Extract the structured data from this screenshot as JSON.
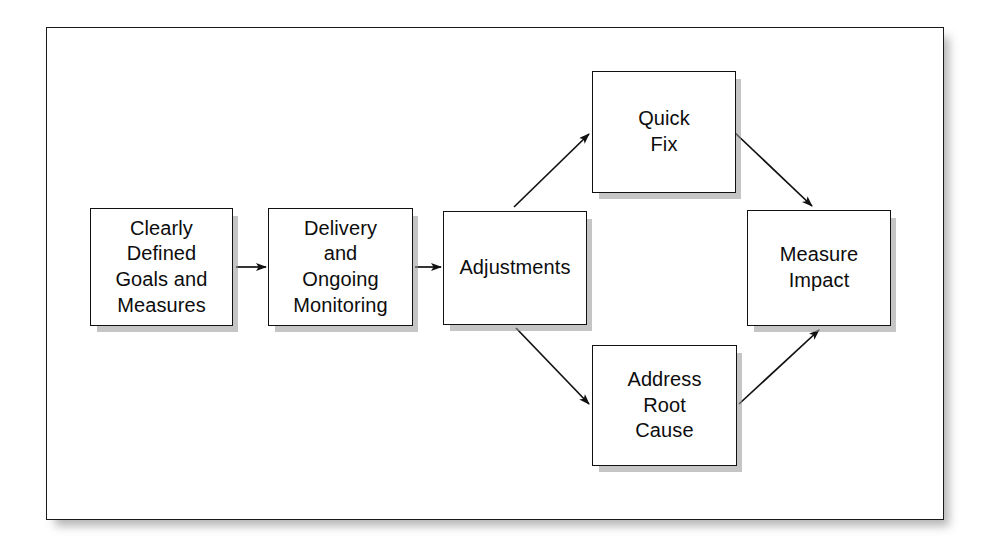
{
  "diagram": {
    "frame": {
      "border_color": "#1a1a1a",
      "background": "#ffffff"
    },
    "node_style": {
      "border_color": "#111111",
      "fill": "#ffffff",
      "shadow_color": "#969696",
      "text_color": "#0d0d0d"
    },
    "nodes": [
      {
        "id": "goals",
        "label": "Clearly\nDefined\nGoals and\nMeasures"
      },
      {
        "id": "delivery",
        "label": "Delivery\nand\nOngoing\nMonitoring"
      },
      {
        "id": "adjust",
        "label": "Adjustments"
      },
      {
        "id": "quickfix",
        "label": "Quick\nFix"
      },
      {
        "id": "rootcause",
        "label": "Address\nRoot\nCause"
      },
      {
        "id": "measure",
        "label": "Measure\nImpact"
      }
    ],
    "edges": [
      {
        "id": "goals-to-delivery",
        "from": "goals",
        "to": "delivery",
        "style": "straight-horizontal",
        "arrow": "end"
      },
      {
        "id": "delivery-to-adjust",
        "from": "delivery",
        "to": "adjust",
        "style": "straight-horizontal",
        "arrow": "end"
      },
      {
        "id": "adjust-to-quickfix",
        "from": "adjust",
        "to": "quickfix",
        "style": "diagonal-up",
        "arrow": "end"
      },
      {
        "id": "adjust-to-rootcause",
        "from": "adjust",
        "to": "rootcause",
        "style": "diagonal-down",
        "arrow": "end"
      },
      {
        "id": "quickfix-to-measure",
        "from": "quickfix",
        "to": "measure",
        "style": "diagonal-down",
        "arrow": "end"
      },
      {
        "id": "rootcause-to-measure",
        "from": "rootcause",
        "to": "measure",
        "style": "diagonal-up",
        "arrow": "end"
      }
    ]
  }
}
